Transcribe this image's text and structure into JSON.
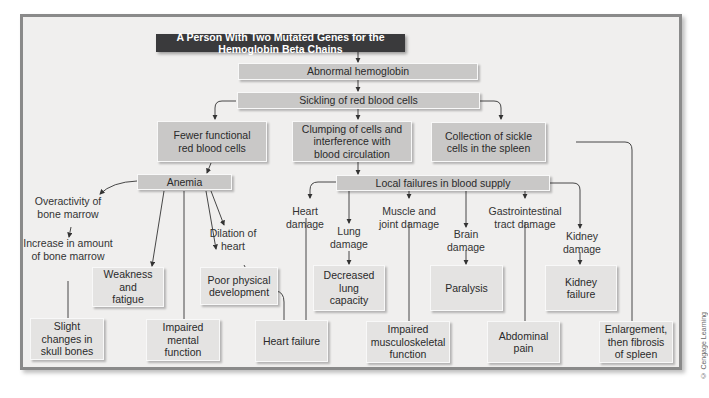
{
  "title": "A Person With Two Mutated Genes for the Hemoglobin Beta Chains",
  "nodes": {
    "abnormal_hemoglobin": "Abnormal hemoglobin",
    "sickling": "Sickling of red blood cells",
    "fewer_rbc": "Fewer functional red blood cells",
    "clumping": "Clumping of cells and interference with blood circulation",
    "collection_spleen": "Collection of sickle cells in the spleen",
    "anemia": "Anemia",
    "local_failures": "Local failures in blood supply",
    "overactivity": "Overactivity of bone marrow",
    "increase_marrow": "Increase in amount of bone marrow",
    "dilation": "Dilation of heart",
    "weakness": "Weakness and fatigue",
    "poor_development": "Poor physical development",
    "skull": "Slight changes in skull bones",
    "mental": "Impaired mental function",
    "heart_failure": "Heart failure",
    "heart_damage": "Heart damage",
    "lung_damage": "Lung damage",
    "muscle_damage": "Muscle and joint damage",
    "brain_damage": "Brain damage",
    "gi_damage": "Gastrointestinal tract damage",
    "kidney_damage": "Kidney damage",
    "decreased_lung": "Decreased lung capacity",
    "paralysis": "Paralysis",
    "kidney_failure": "Kidney failure",
    "musculoskeletal": "Impaired musculoskeletal function",
    "abdominal": "Abdominal pain",
    "spleen_fibrosis": "Enlargement, then fibrosis of spleen"
  },
  "credit": "© Cengage Learning",
  "colors": {
    "title_bg": "#3a3a3c",
    "box_bg": "#e4e3e2",
    "box_dark_bg": "#c9c8c7",
    "frame_bg": "#f0efee",
    "frame_border": "#8a8a8a"
  }
}
